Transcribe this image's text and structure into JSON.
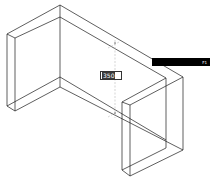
{
  "viewport": {
    "background": "#ffffff",
    "line_color": "#1a1a1a",
    "guide_color": "#bbbbbb"
  },
  "dimension_input": {
    "value": "350"
  },
  "tooltip": {
    "text": "",
    "key_hint": "F1"
  }
}
